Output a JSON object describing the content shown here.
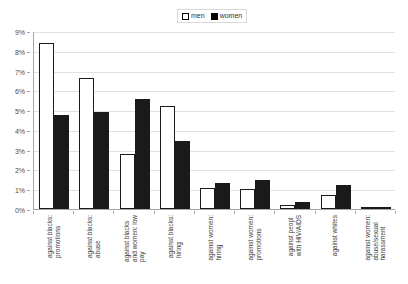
{
  "chart_data": {
    "type": "bar",
    "title": "",
    "subtitle": "",
    "xlabel": "",
    "ylabel": "",
    "ylim": [
      0,
      9
    ],
    "ytick_labels": [
      "0%",
      "1%",
      "2%",
      "3%",
      "4%",
      "5%",
      "6%",
      "7%",
      "8%",
      "9%"
    ],
    "ytick_values": [
      0,
      1,
      2,
      3,
      4,
      5,
      6,
      7,
      8,
      9
    ],
    "grid": true,
    "legend_position": "top-center",
    "categories": [
      "against blacks: promotions",
      "against blacks: abuse",
      "against blacks and women: low pay",
      "against blacks: hiring",
      "against women: hiring",
      "against women: promotions",
      "against peopl with HIV/AIDS",
      "against whites",
      "against women: abuse/sexual harassment"
    ],
    "category_lines": [
      [
        "against blacks:",
        "promotions"
      ],
      [
        "against blacks:",
        "abuse"
      ],
      [
        "against blacks",
        "and women: low",
        "pay"
      ],
      [
        "against blacks:",
        "hiring"
      ],
      [
        "against women:",
        "hiring"
      ],
      [
        "against women:",
        "promotions"
      ],
      [
        "against peopl",
        "with HIV/AIDS"
      ],
      [
        "against whites"
      ],
      [
        "against women:",
        "abuse/sexual",
        "harassment"
      ]
    ],
    "series": [
      {
        "name": "men",
        "color": "#ffffff",
        "edge_color": "#1a1a1a",
        "values": [
          8.4,
          6.6,
          2.8,
          5.2,
          1.05,
          1.0,
          0.2,
          0.7,
          0.1
        ]
      },
      {
        "name": "women",
        "color": "#1a1a1a",
        "edge_color": "#1a1a1a",
        "values": [
          4.75,
          4.9,
          5.55,
          3.45,
          1.3,
          1.45,
          0.35,
          1.2,
          0.12
        ]
      }
    ]
  },
  "legend": {
    "entries": [
      {
        "label": "men"
      },
      {
        "label": "women"
      }
    ]
  },
  "colors": {
    "men_fill": "#ffffff",
    "women_fill": "#1a1a1a",
    "gridline": "#e2e2e2",
    "axis": "#a6a6a6",
    "text": "#4d4d4d",
    "background": "#ffffff"
  }
}
